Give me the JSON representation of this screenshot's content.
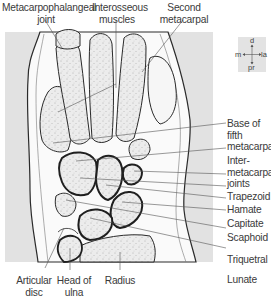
{
  "figure": {
    "type": "anatomical-diagram",
    "colors": {
      "background_panel": "#e4e4e4",
      "soft_tissue": "#ffffff",
      "bone_fill": "#e9e9e9",
      "outline": "#2a2a2a",
      "label_text": "#3a3a3a",
      "leader_line": "#555555"
    }
  },
  "labels": {
    "top": [
      {
        "id": "mcp-joint",
        "lines": [
          "Metacarpophalangeal",
          "joint"
        ]
      },
      {
        "id": "interosseous",
        "lines": [
          "Interosseous",
          "muscles"
        ]
      },
      {
        "id": "second-metacarpal",
        "lines": [
          "Second",
          "metacarpal"
        ]
      }
    ],
    "right": [
      {
        "id": "base-fifth-metacarpal",
        "lines": [
          "Base of",
          "fifth",
          "metacarpal"
        ]
      },
      {
        "id": "intermetacarpal-joints",
        "lines": [
          "Inter-",
          "metacarpal",
          "joints"
        ]
      },
      {
        "id": "trapezoid",
        "lines": [
          "Trapezoid"
        ]
      },
      {
        "id": "hamate",
        "lines": [
          "Hamate"
        ]
      },
      {
        "id": "capitate",
        "lines": [
          "Capitate"
        ]
      },
      {
        "id": "scaphoid",
        "lines": [
          "Scaphoid"
        ]
      },
      {
        "id": "triquetral",
        "lines": [
          "Triquetral"
        ]
      },
      {
        "id": "lunate",
        "lines": [
          "Lunate"
        ]
      }
    ],
    "bottom": [
      {
        "id": "articular-disc",
        "lines": [
          "Articular",
          "disc"
        ]
      },
      {
        "id": "head-of-ulna",
        "lines": [
          "Head of",
          "ulna"
        ]
      },
      {
        "id": "radius",
        "lines": [
          "Radius"
        ]
      }
    ]
  },
  "orientation": {
    "top": "d",
    "bottom": "pr",
    "left": "m",
    "right": "la"
  }
}
